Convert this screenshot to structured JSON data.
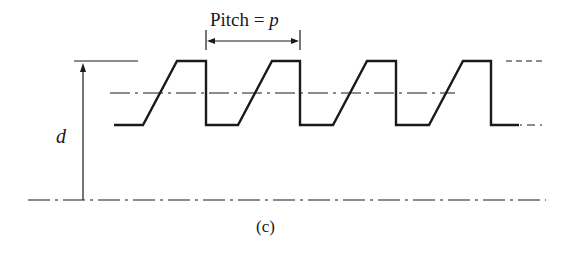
{
  "figure": {
    "pitch_label_prefix": "Pitch = ",
    "pitch_symbol": "p",
    "depth_symbol": "d",
    "caption": "(c)"
  },
  "colors": {
    "stroke": "#1a1a1a",
    "background": "#ffffff"
  }
}
